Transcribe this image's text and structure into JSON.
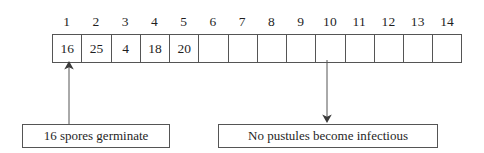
{
  "diagram": {
    "type": "infection-cycle-timeline",
    "timeline": {
      "name": "latent-period-grid",
      "column_headers": [
        "1",
        "2",
        "3",
        "4",
        "5",
        "6",
        "7",
        "8",
        "9",
        "10",
        "11",
        "12",
        "13",
        "14"
      ],
      "cells": [
        {
          "index": 1,
          "value": "16"
        },
        {
          "index": 2,
          "value": "25"
        },
        {
          "index": 3,
          "value": "4"
        },
        {
          "index": 4,
          "value": "18"
        },
        {
          "index": 5,
          "value": "20"
        },
        {
          "index": 6,
          "value": ""
        },
        {
          "index": 7,
          "value": ""
        },
        {
          "index": 8,
          "value": ""
        },
        {
          "index": 9,
          "value": ""
        },
        {
          "index": 10,
          "value": ""
        },
        {
          "index": 11,
          "value": ""
        },
        {
          "index": 12,
          "value": ""
        },
        {
          "index": 13,
          "value": ""
        },
        {
          "index": 14,
          "value": ""
        }
      ]
    },
    "annotations": [
      {
        "name": "left-annotation",
        "label": "16 spores germinate",
        "arrow_direction": "up",
        "points_to_column": "1"
      },
      {
        "name": "right-annotation",
        "label": "No pustules become infectious",
        "arrow_direction": "down",
        "points_to_column": "10"
      }
    ],
    "colors": {
      "background": "#ffffff",
      "line": "#555555",
      "text": "#1f1f1f"
    }
  }
}
